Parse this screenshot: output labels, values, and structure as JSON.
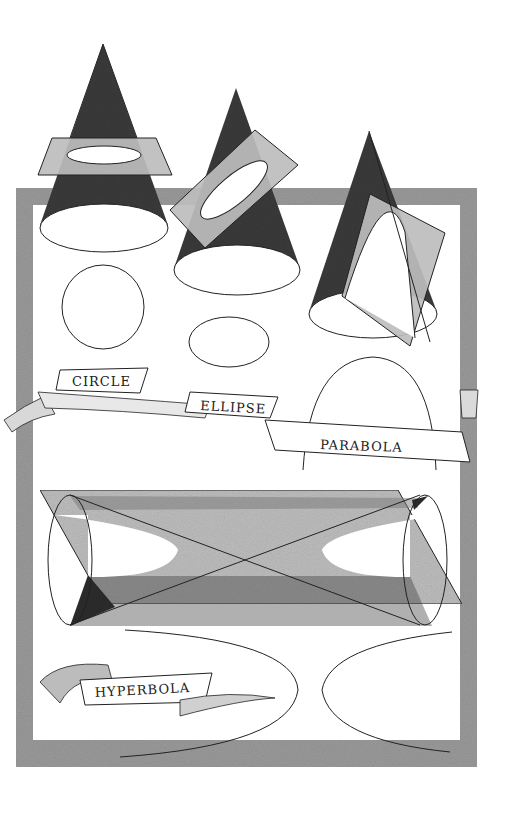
{
  "labels": {
    "circle": "CIRCLE",
    "ellipse": "ELLIPSE",
    "parabola": "PARABOLA",
    "hyperbola": "HYPERBOLA"
  },
  "colors": {
    "cone_dark": "#3a3a3a",
    "plane_gray": "#b8b8b8",
    "frame_gray": "#9a9a9a",
    "line": "#222222",
    "background": "#ffffff"
  },
  "figures": [
    {
      "name": "circle",
      "description": "Cone cut by horizontal plane"
    },
    {
      "name": "ellipse",
      "description": "Cone cut by tilted plane"
    },
    {
      "name": "parabola",
      "description": "Cone cut by plane parallel to side"
    },
    {
      "name": "hyperbola",
      "description": "Double cone cut by vertical plane"
    }
  ]
}
